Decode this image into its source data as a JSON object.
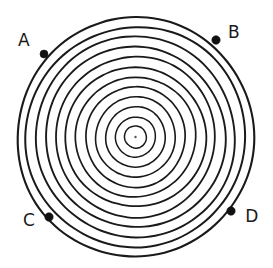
{
  "figure": {
    "kind": "concentric-circles-diagram",
    "style": "hand-drawn ink line art",
    "background_color": "#ffffff",
    "stroke_color": "#1a1a1a",
    "canvas": {
      "width": 273,
      "height": 268
    },
    "center": {
      "x": 135.5,
      "y": 137.0
    },
    "center_dot": {
      "name": "center-point",
      "radius": 1.2,
      "color": "#555555"
    },
    "rings": [
      {
        "index": 1,
        "radius": 11,
        "stroke_width": 1.5
      },
      {
        "index": 2,
        "radius": 20,
        "stroke_width": 1.5
      },
      {
        "index": 3,
        "radius": 30,
        "stroke_width": 1.6
      },
      {
        "index": 4,
        "radius": 40,
        "stroke_width": 1.6
      },
      {
        "index": 5,
        "radius": 50,
        "stroke_width": 1.7
      },
      {
        "index": 6,
        "radius": 60,
        "stroke_width": 1.7
      },
      {
        "index": 7,
        "radius": 70,
        "stroke_width": 1.8
      },
      {
        "index": 8,
        "radius": 80,
        "stroke_width": 1.8
      },
      {
        "index": 9,
        "radius": 90,
        "stroke_width": 1.9
      },
      {
        "index": 10,
        "radius": 100,
        "stroke_width": 1.9
      },
      {
        "index": 11,
        "radius": 110,
        "stroke_width": 2.0
      },
      {
        "index": 12,
        "radius": 119,
        "stroke_width": 2.1
      }
    ],
    "ring_count": 12,
    "points": [
      {
        "id": "A",
        "label": "A",
        "dot": {
          "x": 44,
          "y": 54
        },
        "dot_radius": 4.0,
        "label_pos": {
          "x": 24,
          "y": 41
        },
        "anchor": "middle",
        "on_ring": 12
      },
      {
        "id": "B",
        "label": "B",
        "dot": {
          "x": 216,
          "y": 40
        },
        "dot_radius": 4.2,
        "label_pos": {
          "x": 234,
          "y": 33
        },
        "anchor": "middle",
        "on_ring": 12
      },
      {
        "id": "C",
        "label": "C",
        "dot": {
          "x": 49,
          "y": 217
        },
        "dot_radius": 4.2,
        "label_pos": {
          "x": 29,
          "y": 221
        },
        "anchor": "middle",
        "on_ring": 12
      },
      {
        "id": "D",
        "label": "D",
        "dot": {
          "x": 231,
          "y": 211
        },
        "dot_radius": 4.2,
        "label_pos": {
          "x": 252,
          "y": 217
        },
        "anchor": "middle",
        "on_ring": 12
      }
    ]
  }
}
